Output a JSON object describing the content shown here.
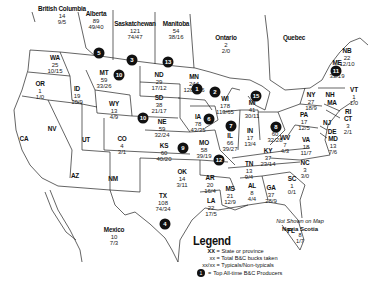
{
  "map": {
    "title_visible": "",
    "regions": [
      {
        "id": "british-columbia",
        "abbr": "British Columbia",
        "total": "14",
        "split": "9/5",
        "x": 62,
        "y": 12
      },
      {
        "id": "alberta",
        "abbr": "Alberta",
        "total": "89",
        "split": "49/40",
        "x": 96,
        "y": 14
      },
      {
        "id": "saskatchewan",
        "abbr": "Saskatchewan",
        "total": "121",
        "split": "74/47",
        "x": 135,
        "y": 24
      },
      {
        "id": "manitoba",
        "abbr": "Manitoba",
        "total": "54",
        "split": "38/16",
        "x": 173,
        "y": 24
      },
      {
        "id": "ontario",
        "abbr": "Ontario",
        "total": "2",
        "split": "2/0",
        "x": 226,
        "y": 36
      },
      {
        "id": "quebec",
        "abbr": "Quebec",
        "total": "",
        "split": "",
        "x": 300,
        "y": 34
      },
      {
        "id": "nb",
        "abbr": "NB",
        "total": "22",
        "split": "12/10",
        "x": 356,
        "y": 48
      },
      {
        "id": "me",
        "abbr": "ME",
        "total": "52",
        "split": "33/19",
        "x": 341,
        "y": 62
      },
      {
        "id": "wa",
        "abbr": "WA",
        "total": "25",
        "split": "10/15",
        "x": 54,
        "y": 56
      },
      {
        "id": "or",
        "abbr": "OR",
        "total": "1",
        "split": "1/0",
        "x": 40,
        "y": 82
      },
      {
        "id": "id",
        "abbr": "ID",
        "total": "19",
        "split": "10/9",
        "x": 77,
        "y": 88
      },
      {
        "id": "mt",
        "abbr": "MT",
        "total": "59",
        "split": "33/26",
        "x": 102,
        "y": 72
      },
      {
        "id": "nd",
        "abbr": "ND",
        "total": "29",
        "split": "17/12",
        "x": 158,
        "y": 74
      },
      {
        "id": "mn",
        "abbr": "MN",
        "total": "244",
        "split": "128/116",
        "x": 195,
        "y": 76
      },
      {
        "id": "wi",
        "abbr": "WI",
        "total": "178",
        "split": "113/65",
        "x": 224,
        "y": 97
      },
      {
        "id": "mi",
        "abbr": "MI",
        "total": "41",
        "split": "30/11",
        "x": 252,
        "y": 97
      },
      {
        "id": "ny",
        "abbr": "NY",
        "total": "27",
        "split": "18/9",
        "x": 311,
        "y": 93
      },
      {
        "id": "vt",
        "abbr": "VT",
        "total": "1",
        "split": "1/0",
        "x": 352,
        "y": 88
      },
      {
        "id": "nh",
        "abbr": "NH",
        "total": "",
        "split": "",
        "x": 332,
        "y": 91
      },
      {
        "id": "ma",
        "abbr": "MA",
        "total": "",
        "split": "",
        "x": 333,
        "y": 100
      },
      {
        "id": "ri",
        "abbr": "RI",
        "total": "",
        "split": "",
        "x": 347,
        "y": 111
      },
      {
        "id": "ct",
        "abbr": "CT",
        "total": "3",
        "split": "2/1",
        "x": 348,
        "y": 118
      },
      {
        "id": "nj",
        "abbr": "NJ",
        "total": "",
        "split": "",
        "x": 330,
        "y": 121
      },
      {
        "id": "de",
        "abbr": "DE",
        "total": "",
        "split": "",
        "x": 334,
        "y": 130
      },
      {
        "id": "md",
        "abbr": "MD",
        "total": "13",
        "split": "7/6",
        "x": 334,
        "y": 138
      },
      {
        "id": "pa",
        "abbr": "PA",
        "total": "17",
        "split": "12/5",
        "x": 302,
        "y": 117
      },
      {
        "id": "sd",
        "abbr": "SD",
        "total": "38",
        "split": "21/17",
        "x": 158,
        "y": 98
      },
      {
        "id": "wy",
        "abbr": "WY",
        "total": "13",
        "split": "4/9",
        "x": 114,
        "y": 101
      },
      {
        "id": "ne",
        "abbr": "NE",
        "total": "59",
        "split": "32/24",
        "x": 163,
        "y": 120
      },
      {
        "id": "ia",
        "abbr": "IA",
        "total": "78",
        "split": "43/35",
        "x": 199,
        "y": 115
      },
      {
        "id": "il",
        "abbr": "IL",
        "total": "66",
        "split": "39/27",
        "x": 230,
        "y": 132
      },
      {
        "id": "in",
        "abbr": "IN",
        "total": "17",
        "split": "13/4",
        "x": 250,
        "y": 128
      },
      {
        "id": "oh",
        "abbr": "OH",
        "total": "60",
        "split": "32/28",
        "x": 275,
        "y": 124
      },
      {
        "id": "wv",
        "abbr": "WV",
        "total": "7",
        "split": "4/3",
        "x": 283,
        "y": 137
      },
      {
        "id": "va",
        "abbr": "VA",
        "total": "18",
        "split": "11/7",
        "x": 306,
        "y": 138
      },
      {
        "id": "nv",
        "abbr": "NV",
        "total": "",
        "split": "",
        "x": 52,
        "y": 130
      },
      {
        "id": "ca",
        "abbr": "CA",
        "total": "",
        "split": "",
        "x": 24,
        "y": 138
      },
      {
        "id": "ut",
        "abbr": "UT",
        "total": "",
        "split": "",
        "x": 86,
        "y": 139
      },
      {
        "id": "co",
        "abbr": "CO",
        "total": "4",
        "split": "3/1",
        "x": 122,
        "y": 136
      },
      {
        "id": "ks",
        "abbr": "KS",
        "total": "60",
        "split": "40/20",
        "x": 165,
        "y": 143
      },
      {
        "id": "mo",
        "abbr": "MO",
        "total": "58",
        "split": "39/19",
        "x": 204,
        "y": 140
      },
      {
        "id": "ky",
        "abbr": "KY",
        "total": "37",
        "split": "23/14",
        "x": 268,
        "y": 150
      },
      {
        "id": "tn",
        "abbr": "TN",
        "total": "13",
        "split": "9/4",
        "x": 248,
        "y": 163
      },
      {
        "id": "nc",
        "abbr": "NC",
        "total": "3",
        "split": "3/0",
        "x": 304,
        "y": 163
      },
      {
        "id": "sc",
        "abbr": "SC",
        "total": "1",
        "split": "0/1",
        "x": 292,
        "y": 178
      },
      {
        "id": "az",
        "abbr": "AZ",
        "total": "",
        "split": "",
        "x": 75,
        "y": 175
      },
      {
        "id": "nm",
        "abbr": "NM",
        "total": "",
        "split": "",
        "x": 113,
        "y": 178
      },
      {
        "id": "ok",
        "abbr": "OK",
        "total": "14",
        "split": "3/11",
        "x": 180,
        "y": 168
      },
      {
        "id": "ar",
        "abbr": "AR",
        "total": "20",
        "split": "16/4",
        "x": 210,
        "y": 177
      },
      {
        "id": "ms",
        "abbr": "MS",
        "total": "21",
        "split": "12/9",
        "x": 230,
        "y": 187
      },
      {
        "id": "al",
        "abbr": "AL",
        "total": "8",
        "split": "4/4",
        "x": 251,
        "y": 184
      },
      {
        "id": "ga",
        "abbr": "GA",
        "total": "37",
        "split": "28/9",
        "x": 272,
        "y": 186
      },
      {
        "id": "la",
        "abbr": "LA",
        "total": "22",
        "split": "17/5",
        "x": 211,
        "y": 198
      },
      {
        "id": "tx",
        "abbr": "TX",
        "total": "108",
        "split": "74/34",
        "x": 162,
        "y": 194
      },
      {
        "id": "fl",
        "abbr": "FL",
        "total": "",
        "split": "",
        "x": 292,
        "y": 230
      },
      {
        "id": "mexico",
        "abbr": "Mexico",
        "total": "10",
        "split": "7/3",
        "x": 114,
        "y": 228
      }
    ],
    "top_producers": [
      {
        "rank": "1",
        "x": 197,
        "y": 89
      },
      {
        "rank": "2",
        "x": 215,
        "y": 92
      },
      {
        "rank": "3",
        "x": 132,
        "y": 60
      },
      {
        "rank": "4",
        "x": 165,
        "y": 224
      },
      {
        "rank": "5",
        "x": 99,
        "y": 53
      },
      {
        "rank": "6",
        "x": 209,
        "y": 119
      },
      {
        "rank": "7",
        "x": 247,
        "y": 124
      },
      {
        "rank": "8",
        "x": 278,
        "y": 126
      },
      {
        "rank": "9",
        "x": 182,
        "y": 151
      },
      {
        "rank": "10",
        "x": 118,
        "y": 75
      },
      {
        "rank": "10",
        "x": 143,
        "y": 118
      },
      {
        "rank": "11",
        "x": 336,
        "y": 71
      },
      {
        "rank": "12",
        "x": 219,
        "y": 159
      },
      {
        "rank": "13",
        "x": 168,
        "y": 62
      },
      {
        "rank": "15",
        "x": 253,
        "y": 93
      }
    ],
    "not_shown": {
      "heading": "Not Shown on Map",
      "region": "Novia Scotia",
      "total": "8",
      "split": "1/7"
    },
    "legend": {
      "title": "Legend",
      "rows": [
        {
          "key": "XX",
          "desc": "State or province"
        },
        {
          "key": "xx",
          "desc": "Total B&C bucks taken"
        },
        {
          "key": "xx/xx",
          "desc": "Typicals/Non-typicals"
        }
      ],
      "dot_row": {
        "num": "1",
        "desc": "Top All-time B&C Producers"
      }
    }
  }
}
